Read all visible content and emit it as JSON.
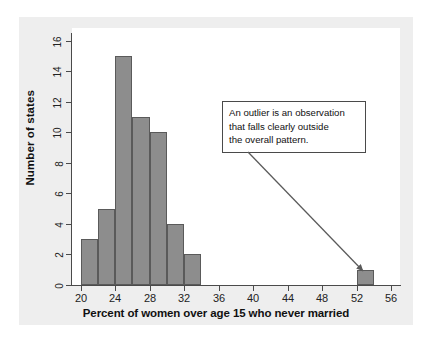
{
  "figure": {
    "background_color": "#eeeeee",
    "plot_background_color": "#ffffff",
    "bar_fill_color": "#8d8d8d",
    "bar_edge_color": "#5a5a5a",
    "axis_color": "#4a4a4a"
  },
  "annotation": {
    "text": "An outlier is an observation\nthat falls clearly outside\nthe overall pattern.",
    "lines": [
      "An outlier is an observation",
      "that falls clearly outside",
      "the overall pattern."
    ],
    "points_to": "outlier-bar"
  },
  "chart_data": {
    "type": "bar",
    "title": "",
    "xlabel": "Percent of women over age 15 who never married",
    "ylabel": "Number of states",
    "xlim": [
      19,
      57
    ],
    "ylim": [
      0,
      16.5
    ],
    "xticks": [
      20,
      24,
      28,
      32,
      36,
      40,
      44,
      48,
      52,
      56
    ],
    "xtick_labels": [
      "20",
      "24",
      "28",
      "32",
      "36",
      "40",
      "44",
      "48",
      "52",
      "56"
    ],
    "yticks": [
      0,
      2,
      4,
      6,
      8,
      10,
      12,
      14,
      16
    ],
    "ytick_labels": [
      "0",
      "2",
      "4",
      "6",
      "8",
      "10",
      "12",
      "14",
      "16"
    ],
    "grid": false,
    "legend": false,
    "bin_width": 2,
    "categories": [
      "20-22",
      "22-24",
      "24-26",
      "26-28",
      "28-30",
      "30-32",
      "32-34",
      "52-54"
    ],
    "bins": [
      {
        "start": 20,
        "end": 22,
        "count": 3
      },
      {
        "start": 22,
        "end": 24,
        "count": 5
      },
      {
        "start": 24,
        "end": 26,
        "count": 15
      },
      {
        "start": 26,
        "end": 28,
        "count": 11
      },
      {
        "start": 28,
        "end": 30,
        "count": 10
      },
      {
        "start": 30,
        "end": 32,
        "count": 4
      },
      {
        "start": 32,
        "end": 34,
        "count": 2
      },
      {
        "start": 52,
        "end": 54,
        "count": 1
      }
    ],
    "values": [
      3,
      5,
      15,
      11,
      10,
      4,
      2,
      1
    ]
  }
}
